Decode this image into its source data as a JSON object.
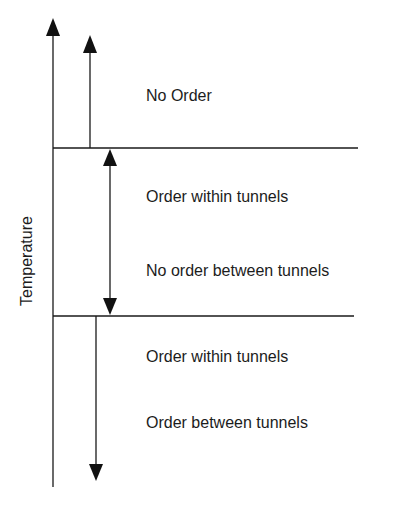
{
  "diagram": {
    "axis_label": "Temperature",
    "regions": [
      {
        "id": "high",
        "lines": [
          "No Order"
        ]
      },
      {
        "id": "middle",
        "lines": [
          "Order within tunnels",
          "No order between tunnels"
        ]
      },
      {
        "id": "low",
        "lines": [
          "Order within tunnels",
          "Order between tunnels"
        ]
      }
    ],
    "colors": {
      "line": "#1a1a1a",
      "background": "#ffffff"
    }
  }
}
